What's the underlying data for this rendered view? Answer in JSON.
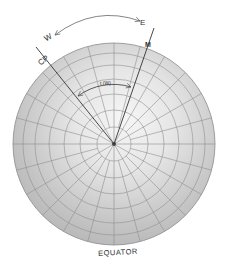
{
  "diagram": {
    "type": "polar-projection",
    "labels": {
      "west": "W",
      "east": "E",
      "celestial_pole_line": "CP",
      "meridian_line": "M",
      "hour_angle": "t (W)",
      "equator": "EQUATOR"
    },
    "colors": {
      "globe_light": "#f4f4f4",
      "globe_mid": "#d4d4d4",
      "globe_dark": "#a8a8a8",
      "grid": "#8a8a8a",
      "ink": "#333333"
    },
    "geometry": {
      "center": [
        114,
        144
      ],
      "radius": 101,
      "parallels": 6,
      "meridians": 24
    }
  }
}
